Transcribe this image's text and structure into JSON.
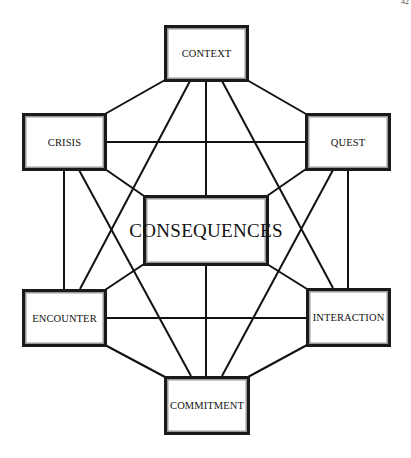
{
  "page": {
    "number": "42"
  },
  "diagram": {
    "title": "",
    "center_node": {
      "id": "consequences",
      "label": "CONSEQUENCES"
    },
    "nodes": [
      {
        "id": "context",
        "label": "CONTEXT",
        "position": "top"
      },
      {
        "id": "crisis",
        "label": "CRISIS",
        "position": "upper-left"
      },
      {
        "id": "quest",
        "label": "QUEST",
        "position": "upper-right"
      },
      {
        "id": "consequences",
        "label": "CONSEQUENCES",
        "position": "center"
      },
      {
        "id": "encounter",
        "label": "ENCOUNTER",
        "position": "lower-left"
      },
      {
        "id": "interaction",
        "label": "INTERACTION",
        "position": "lower-right"
      },
      {
        "id": "commitment",
        "label": "COMMITMENT",
        "position": "bottom"
      }
    ],
    "edges": [
      {
        "from": "context",
        "to": "crisis"
      },
      {
        "from": "context",
        "to": "quest"
      },
      {
        "from": "context",
        "to": "consequences"
      },
      {
        "from": "context",
        "to": "encounter"
      },
      {
        "from": "context",
        "to": "interaction"
      },
      {
        "from": "crisis",
        "to": "quest"
      },
      {
        "from": "crisis",
        "to": "consequences"
      },
      {
        "from": "crisis",
        "to": "encounter"
      },
      {
        "from": "crisis",
        "to": "commitment"
      },
      {
        "from": "quest",
        "to": "consequences"
      },
      {
        "from": "quest",
        "to": "interaction"
      },
      {
        "from": "quest",
        "to": "commitment"
      },
      {
        "from": "encounter",
        "to": "consequences"
      },
      {
        "from": "encounter",
        "to": "interaction"
      },
      {
        "from": "encounter",
        "to": "commitment"
      },
      {
        "from": "interaction",
        "to": "consequences"
      },
      {
        "from": "interaction",
        "to": "commitment"
      },
      {
        "from": "consequences",
        "to": "commitment"
      }
    ],
    "colors": {
      "line": "#111111",
      "box_border": "#1a1a1a",
      "box_inner_border": "#9a9a9a",
      "background": "#ffffff"
    }
  }
}
